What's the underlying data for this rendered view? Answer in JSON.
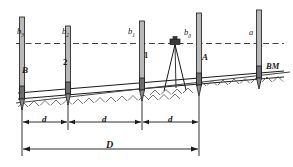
{
  "figure": {
    "type": "differential-leveling-diagram",
    "title": "",
    "colors": {
      "line": "#1a1a1a",
      "rod_fill": "#b8b8b8",
      "rod_dark": "#6e6e6e",
      "instrument": "#3a3a3a",
      "ground": "#555555",
      "sight_line": "#2b2b2b"
    }
  },
  "sight_line": {
    "style": "dashed",
    "label": "line of sight"
  },
  "rod_labels": [
    {
      "id": "rod-reading-b3",
      "base": "b",
      "sub": "3",
      "x": 17,
      "y": 27
    },
    {
      "id": "rod-reading-b2",
      "base": "b",
      "sub": "2",
      "x": 62,
      "y": 27
    },
    {
      "id": "rod-reading-b1",
      "base": "b",
      "sub": "1",
      "x": 128,
      "y": 27
    },
    {
      "id": "rod-reading-b0",
      "base": "b",
      "sub": "0",
      "x": 184,
      "y": 28
    },
    {
      "id": "rod-reading-a",
      "base": "a",
      "sub": "",
      "x": 249,
      "y": 28
    }
  ],
  "station_labels": [
    {
      "id": "station-b",
      "text": "B",
      "x": 22,
      "y": 66
    },
    {
      "id": "station-2",
      "text": "2",
      "x": 63,
      "y": 58
    },
    {
      "id": "station-1",
      "text": "1",
      "x": 144,
      "y": 51
    },
    {
      "id": "station-a",
      "text": "A",
      "x": 202,
      "y": 53
    },
    {
      "id": "benchmark",
      "text": "BM",
      "x": 266,
      "y": 62
    }
  ],
  "dimensions": {
    "segments": [
      {
        "id": "segment-d-1",
        "label": "d",
        "x": 44,
        "y": 119
      },
      {
        "id": "segment-d-2",
        "label": "d",
        "x": 106,
        "y": 119
      },
      {
        "id": "segment-d-3",
        "label": "d",
        "x": 168,
        "y": 119
      }
    ],
    "total": {
      "id": "total-span-d",
      "label": "D",
      "x": 106,
      "y": 146
    }
  },
  "instrument": {
    "name": "level-on-tripod",
    "x": 175,
    "y": 45
  },
  "rods": [
    {
      "id": "rod-b",
      "x": 22,
      "top": 17,
      "bottom": 99
    },
    {
      "id": "rod-2",
      "x": 68,
      "top": 26,
      "bottom": 94
    },
    {
      "id": "rod-1",
      "x": 142,
      "top": 21,
      "bottom": 90
    },
    {
      "id": "rod-a",
      "x": 199,
      "top": 13,
      "bottom": 85
    },
    {
      "id": "rod-bm",
      "x": 259,
      "top": 10,
      "bottom": 78
    }
  ]
}
